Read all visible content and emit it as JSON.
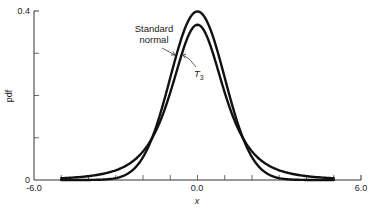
{
  "chart_data": {
    "type": "line",
    "title": "",
    "xlabel": "x",
    "ylabel": "pdf",
    "xlim": [
      -6.0,
      6.0
    ],
    "ylim": [
      0,
      0.4
    ],
    "x_tick_labels": [
      "-6.0",
      "0.0",
      "6.0"
    ],
    "x_minor_ticks": [
      -5,
      -4,
      -3,
      -2,
      -1,
      1,
      2,
      3,
      4,
      5
    ],
    "y_tick_labels": [
      "0",
      "0.4"
    ],
    "y_minor_ticks": [
      0.1,
      0.2,
      0.3
    ],
    "grid": false,
    "legend": "none (inline annotations)",
    "series": [
      {
        "name": "Standard normal",
        "distribution": "normal(0,1)",
        "x_range": [
          -5.0,
          5.0
        ],
        "peak": 0.399,
        "x": [
          -5,
          -4,
          -3,
          -2,
          -1,
          0,
          1,
          2,
          3,
          4,
          5
        ],
        "values": [
          0.0,
          0.0001,
          0.0044,
          0.054,
          0.242,
          0.3989,
          0.242,
          0.054,
          0.0044,
          0.0001,
          0.0
        ]
      },
      {
        "name": "T3",
        "distribution": "student-t(df=3)",
        "x_range": [
          -5.0,
          5.0
        ],
        "peak": 0.368,
        "x": [
          -5,
          -4,
          -3,
          -2,
          -1,
          0,
          1,
          2,
          3,
          4,
          5
        ],
        "values": [
          0.0042,
          0.0092,
          0.023,
          0.0675,
          0.2067,
          0.3676,
          0.2067,
          0.0675,
          0.023,
          0.0092,
          0.0042
        ]
      }
    ],
    "annotations": [
      {
        "text": "Standard normal",
        "points_to": "Standard normal"
      },
      {
        "text": "T3",
        "points_to": "T3"
      }
    ]
  },
  "labels": {
    "x_axis": "x",
    "y_axis": "pdf",
    "x_min": "-6.0",
    "x_mid": "0.0",
    "x_max": "6.0",
    "y_min": "0",
    "y_max": "0.4",
    "annot_normal_line1": "Standard",
    "annot_normal_line2": "normal",
    "annot_t_main": "T",
    "annot_t_sub": "3"
  }
}
